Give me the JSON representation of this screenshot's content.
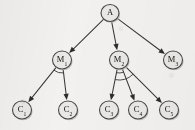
{
  "figure": {
    "type": "tree-graph",
    "background_color": "#f2f1ef",
    "node_fill_color": "#e9e8e6",
    "node_stroke_color": "#4a4845",
    "edge_color": "#3b3936"
  },
  "nodes": [
    {
      "id": "A",
      "base": "A",
      "sub": "",
      "cx": 110,
      "cy": 13,
      "r": 9,
      "level": 0
    },
    {
      "id": "M1",
      "base": "M",
      "sub": "1",
      "cx": 62,
      "cy": 60,
      "r": 9.5,
      "level": 1
    },
    {
      "id": "M2",
      "base": "M",
      "sub": "2",
      "cx": 119,
      "cy": 60,
      "r": 9.5,
      "level": 1
    },
    {
      "id": "M3",
      "base": "M",
      "sub": "3",
      "cx": 173,
      "cy": 60,
      "r": 9.5,
      "level": 1
    },
    {
      "id": "C1",
      "base": "C",
      "sub": "1",
      "cx": 22,
      "cy": 110,
      "r": 9.5,
      "level": 2
    },
    {
      "id": "C2",
      "base": "C",
      "sub": "2",
      "cx": 68,
      "cy": 110,
      "r": 9.5,
      "level": 2
    },
    {
      "id": "C3",
      "base": "C",
      "sub": "3",
      "cx": 109,
      "cy": 110,
      "r": 9.5,
      "level": 2
    },
    {
      "id": "C4",
      "base": "C",
      "sub": "4",
      "cx": 138,
      "cy": 110,
      "r": 9.5,
      "level": 2
    },
    {
      "id": "C5",
      "base": "C",
      "sub": "5",
      "cx": 169,
      "cy": 110,
      "r": 9.5,
      "level": 2
    }
  ],
  "edges": [
    {
      "from": "A",
      "to": "M1",
      "arrow": true
    },
    {
      "from": "A",
      "to": "M2",
      "arrow": true
    },
    {
      "from": "A",
      "to": "M3",
      "arrow": true
    },
    {
      "from": "M1",
      "to": "C1",
      "arrow": true
    },
    {
      "from": "M1",
      "to": "C2",
      "arrow": true
    },
    {
      "from": "M2",
      "to": "C3",
      "arrow": true
    },
    {
      "from": "M2",
      "to": "C4",
      "arrow": true
    },
    {
      "from": "M2",
      "to": "C5",
      "arrow": true
    }
  ],
  "angle_marks": [
    {
      "at": "M1",
      "radius": 13,
      "between": [
        "C1",
        "C2"
      ]
    },
    {
      "at": "M2",
      "radius": 13,
      "between": [
        "C3",
        "C4"
      ]
    },
    {
      "at": "M2",
      "radius": 20,
      "between": [
        "C3",
        "C5"
      ]
    }
  ],
  "labels": {
    "A": "A",
    "M1": "M₁",
    "M2": "M₂",
    "M3": "M₃",
    "C1": "C₁",
    "C2": "C₂",
    "C3": "C₃",
    "C4": "C₄",
    "C5": "C₅"
  }
}
